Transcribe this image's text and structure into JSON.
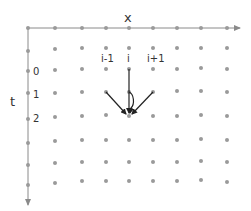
{
  "diagram": {
    "x_axis_label": "x",
    "t_axis_label": "t",
    "column_labels": [
      "i-1",
      "i",
      "i+1"
    ],
    "row_labels": [
      "0",
      "1",
      "2"
    ],
    "colors": {
      "axis": "#8a8a8a",
      "dot": "#9a9a9a",
      "arrow": "#222222",
      "text": "#333333"
    },
    "grid": {
      "columns": 9,
      "rows": 8
    },
    "stencil": {
      "target": "point (i, t=2)",
      "sources": [
        "point (i-1, t=1)",
        "point (i, t=0)",
        "point (i+1, t=1)",
        "point (i, t=1)"
      ]
    }
  }
}
